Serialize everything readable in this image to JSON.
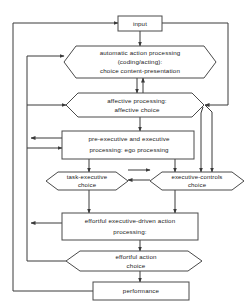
{
  "diagram": {
    "colors": {
      "stroke": "#4a4a4a",
      "connector": "#3a3a3a",
      "text": "#1a1a1a",
      "background": "#ffffff"
    },
    "nodes": [
      {
        "id": "input",
        "shape": "rect",
        "lines": [
          "input"
        ]
      },
      {
        "id": "automatic-action-processing",
        "shape": "hexagon",
        "lines": [
          "automatic action processing",
          "(coding/acting):",
          "choice content-presentation"
        ]
      },
      {
        "id": "affective-processing",
        "shape": "hexagon",
        "lines": [
          "affective processing:",
          "affective choice"
        ]
      },
      {
        "id": "pre-executive-and-executive-processing",
        "shape": "rect",
        "lines": [
          "pre-executive and executive",
          "processing: ego processing"
        ]
      },
      {
        "id": "task-executive-choice",
        "shape": "hexagon",
        "lines": [
          "task-executive",
          "choice"
        ]
      },
      {
        "id": "executive-controls-choice",
        "shape": "hexagon",
        "lines": [
          "executive-controls",
          "choice"
        ]
      },
      {
        "id": "effortful-executive-driven-action-processing",
        "shape": "rect",
        "lines": [
          "effortful executive-driven action",
          "processing:"
        ]
      },
      {
        "id": "effortful-action-choice",
        "shape": "hexagon",
        "lines": [
          "effortful action",
          "choice"
        ]
      },
      {
        "id": "performance",
        "shape": "rect",
        "lines": [
          "performance"
        ]
      }
    ]
  }
}
